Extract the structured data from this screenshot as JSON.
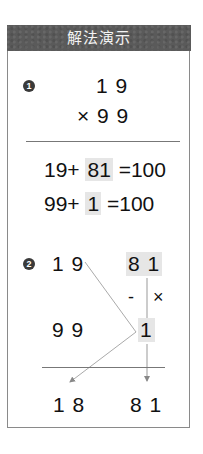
{
  "header": {
    "title": "解法演示"
  },
  "step1": {
    "badge": "1",
    "multiplicand": "1 9",
    "multiplier_line": "× 9 9",
    "equations": [
      {
        "left": "19+",
        "highlight": "81",
        "right": "=100"
      },
      {
        "left": "99+",
        "highlight": "1",
        "right": "=100"
      }
    ]
  },
  "step2": {
    "badge": "2",
    "top_left": "1 9",
    "top_right": "8 1",
    "minus_sign": "-",
    "times_sign": "×",
    "mid_left": "9 9",
    "mid_right": "1",
    "result_left": "1 8",
    "result_right": "8 1"
  },
  "colors": {
    "header_bg": "#5a5a5a",
    "header_text": "#f4f4f4",
    "highlight_bg": "#e6e6e6",
    "border": "#8a8a8a",
    "line": "#999999"
  }
}
